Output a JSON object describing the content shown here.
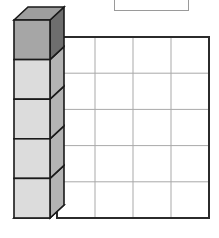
{
  "figure": {
    "kind": "isometric-block-diagram",
    "canvas": {
      "width": 219,
      "height": 238
    },
    "background_color": "#ffffff",
    "top_box": {
      "name": "empty-answer-box",
      "label": "",
      "x": 114,
      "y": -8,
      "width": 74,
      "height": 18,
      "fill": "#ffffff",
      "stroke": "#9a9a9a",
      "stroke_width": 1
    },
    "block_stack": {
      "count": 5,
      "front_face": {
        "x": 14,
        "y": 20,
        "width": 36,
        "height": 198,
        "cell_height": 39.6
      },
      "depth_offset": {
        "dx": 14,
        "dy": -13
      },
      "outline_color": "#1a1a1a",
      "outline_width": 1.6,
      "cells": [
        {
          "index": 0,
          "shaded": true,
          "front_fill": "#a6a6a6",
          "side_fill": "#6e6e6e",
          "top_fill": "#9e9e9e"
        },
        {
          "index": 1,
          "shaded": false,
          "front_fill": "#dcdcdc",
          "side_fill": "#b4b4b4",
          "top_fill": "#c8c8c8"
        },
        {
          "index": 2,
          "shaded": false,
          "front_fill": "#dcdcdc",
          "side_fill": "#b4b4b4",
          "top_fill": "#c8c8c8"
        },
        {
          "index": 3,
          "shaded": false,
          "front_fill": "#dcdcdc",
          "side_fill": "#b4b4b4",
          "top_fill": "#c8c8c8"
        },
        {
          "index": 4,
          "shaded": false,
          "front_fill": "#dcdcdc",
          "side_fill": "#b4b4b4",
          "top_fill": "#c8c8c8"
        }
      ],
      "bottom_face_fill": "#a6a6a6"
    },
    "grid": {
      "name": "cell-grid",
      "columns": 4,
      "rows": 5,
      "x": 57,
      "y": 37,
      "width": 152,
      "height": 181,
      "cell_fill": "#ffffff",
      "border_color": "#2b2b2b",
      "border_width": 2,
      "gridline_color": "#a9a9a9",
      "gridline_width": 1,
      "column_edges": [
        57,
        95,
        133,
        171,
        209
      ],
      "row_edges": [
        37,
        73.2,
        109.4,
        145.6,
        181.8,
        218
      ]
    }
  }
}
